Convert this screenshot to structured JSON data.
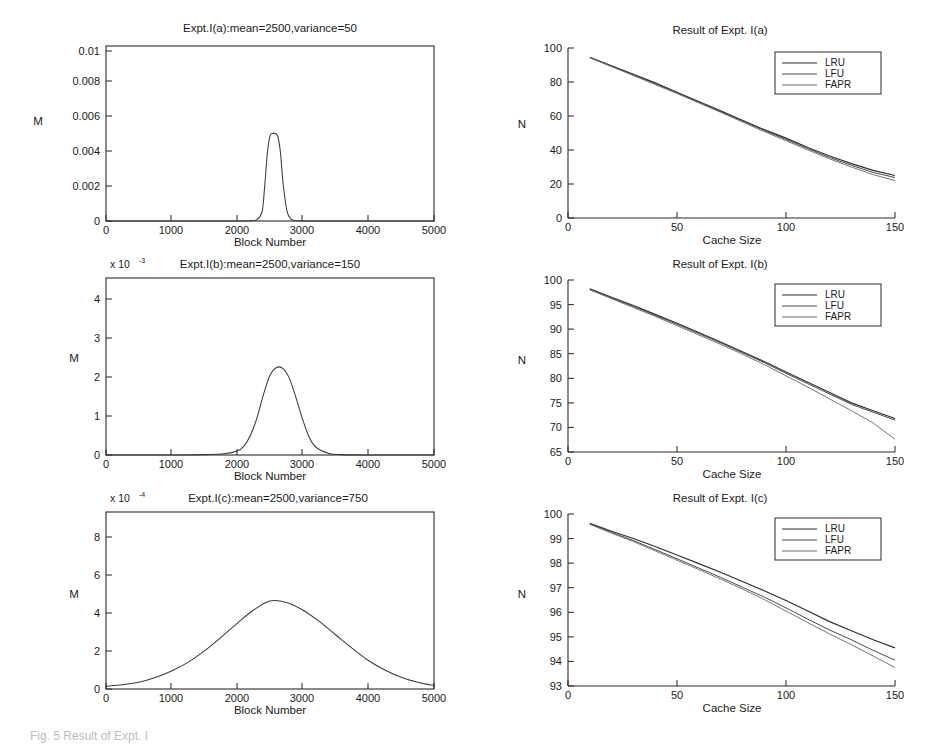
{
  "figure": {
    "caption": "Fig. 5 Result of Expt. I",
    "axis_labels": {
      "block_number": "Block Number",
      "cache_size": "Cache Size",
      "m": "M",
      "n": "N"
    },
    "legend_entries": [
      "LRU",
      "LFU",
      "FAPR"
    ],
    "exponent_prefix": "x 10"
  },
  "chart_data": [
    {
      "id": "expt-1a-distribution",
      "type": "line",
      "title": "Expt.I(a):mean=2500,variance=50",
      "xlabel": "Block Number",
      "ylabel": "M",
      "xlim": [
        0,
        5000
      ],
      "ylim": [
        0,
        0.0108
      ],
      "xticks": [
        0,
        1000,
        2000,
        3000,
        4000,
        5000
      ],
      "xtick_labels": [
        "0",
        "1000",
        "2000",
        "3000",
        "4000",
        "5000"
      ],
      "yticks": [
        0,
        0.002,
        0.004,
        0.006,
        0.008,
        0.01
      ],
      "ytick_labels": [
        "0",
        "0.002",
        "0.004",
        "0.006",
        "0.008",
        "0.01"
      ],
      "exponent": "",
      "grid": false,
      "distribution": {
        "mean": 2500,
        "variance": 50,
        "std_dev": 75,
        "peak_value": 0.0054
      },
      "x": [
        0,
        500,
        1000,
        1500,
        2000,
        2200,
        2300,
        2380,
        2420,
        2460,
        2500,
        2540,
        2580,
        2620,
        2660,
        2700,
        2760,
        2820,
        2900,
        3000,
        3500,
        4000,
        4500,
        5000
      ],
      "values": [
        0,
        0,
        0,
        0,
        0,
        2e-05,
        8e-05,
        0.0006,
        0.0022,
        0.0042,
        0.00525,
        0.0054,
        0.0054,
        0.0052,
        0.0042,
        0.0023,
        0.0006,
        0.00012,
        2e-05,
        0,
        0,
        0,
        0,
        0
      ]
    },
    {
      "id": "expt-1a-result",
      "type": "line",
      "title": "Result of Expt. I(a)",
      "xlabel": "Cache Size",
      "ylabel": "N",
      "xlim": [
        0,
        150
      ],
      "ylim": [
        0,
        100
      ],
      "xticks": [
        0,
        50,
        100,
        150
      ],
      "xtick_labels": [
        "0",
        "50",
        "100",
        "150"
      ],
      "yticks": [
        0,
        20,
        40,
        60,
        80,
        100
      ],
      "ytick_labels": [
        "0",
        "20",
        "40",
        "60",
        "80",
        "100"
      ],
      "grid": false,
      "legend_position": "top-right",
      "x": [
        10,
        20,
        30,
        40,
        50,
        60,
        70,
        80,
        90,
        100,
        110,
        120,
        130,
        140,
        150
      ],
      "series": [
        {
          "name": "LRU",
          "values": [
            94.5,
            89.5,
            84.5,
            79.5,
            74.0,
            68.5,
            63.0,
            57.5,
            52.0,
            47.0,
            41.5,
            36.5,
            32.0,
            28.0,
            25.0
          ]
        },
        {
          "name": "LFU",
          "values": [
            94.5,
            89.3,
            84.2,
            79.0,
            73.6,
            68.1,
            62.6,
            57.0,
            51.5,
            46.2,
            40.8,
            35.6,
            31.0,
            26.8,
            23.8
          ]
        },
        {
          "name": "FAPR",
          "values": [
            94.3,
            89.0,
            83.8,
            78.5,
            73.2,
            67.7,
            62.2,
            56.5,
            50.8,
            45.5,
            40.0,
            34.8,
            30.0,
            25.5,
            22.0
          ]
        }
      ]
    },
    {
      "id": "expt-1b-distribution",
      "type": "line",
      "title": "Expt.I(b):mean=2500,variance=150",
      "xlabel": "Block Number",
      "ylabel": "M",
      "xlim": [
        0,
        5000
      ],
      "ylim": [
        0,
        4.55
      ],
      "xticks": [
        0,
        1000,
        2000,
        3000,
        4000,
        5000
      ],
      "xtick_labels": [
        "0",
        "1000",
        "2000",
        "3000",
        "4000",
        "5000"
      ],
      "yticks": [
        0,
        1,
        2,
        3,
        4
      ],
      "ytick_labels": [
        "0",
        "1",
        "2",
        "3",
        "4"
      ],
      "exponent": "x 10",
      "exponent_power": "-3",
      "grid": false,
      "distribution": {
        "mean": 2500,
        "variance": 150,
        "std_dev": 180,
        "peak_value": 2.25
      },
      "x": [
        0,
        500,
        1000,
        1500,
        1800,
        2000,
        2100,
        2200,
        2300,
        2400,
        2500,
        2600,
        2700,
        2800,
        2900,
        3000,
        3100,
        3200,
        3400,
        3600,
        4000,
        4500,
        5000
      ],
      "values": [
        0,
        0,
        0,
        0.01,
        0.03,
        0.1,
        0.22,
        0.5,
        0.95,
        1.55,
        2.05,
        2.25,
        2.22,
        1.95,
        1.45,
        0.9,
        0.45,
        0.2,
        0.04,
        0.01,
        0,
        0,
        0
      ]
    },
    {
      "id": "expt-1b-result",
      "type": "line",
      "title": "Result of Expt. I(b)",
      "xlabel": "Cache Size",
      "ylabel": "N",
      "xlim": [
        0,
        150
      ],
      "ylim": [
        65,
        100
      ],
      "xticks": [
        0,
        50,
        100,
        150
      ],
      "xtick_labels": [
        "0",
        "50",
        "100",
        "150"
      ],
      "yticks": [
        65,
        70,
        75,
        80,
        85,
        90,
        95,
        100
      ],
      "ytick_labels": [
        "65",
        "70",
        "75",
        "80",
        "85",
        "90",
        "95",
        "100"
      ],
      "grid": false,
      "legend_position": "top-right",
      "x": [
        10,
        20,
        30,
        40,
        50,
        60,
        70,
        80,
        90,
        100,
        110,
        120,
        130,
        140,
        150
      ],
      "series": [
        {
          "name": "LRU",
          "values": [
            98.2,
            96.5,
            94.8,
            93.0,
            91.2,
            89.3,
            87.4,
            85.4,
            83.4,
            81.3,
            79.2,
            77.1,
            75.0,
            73.4,
            71.8
          ]
        },
        {
          "name": "LFU",
          "values": [
            98.1,
            96.3,
            94.6,
            92.8,
            91.0,
            89.1,
            87.2,
            85.2,
            83.2,
            81.0,
            78.9,
            76.8,
            74.7,
            73.1,
            71.5
          ]
        },
        {
          "name": "FAPR",
          "values": [
            98.0,
            96.2,
            94.4,
            92.6,
            90.7,
            88.8,
            86.9,
            84.9,
            82.8,
            80.5,
            78.2,
            75.8,
            73.4,
            70.9,
            67.6
          ]
        }
      ]
    },
    {
      "id": "expt-1c-distribution",
      "type": "line",
      "title": "Expt.I(c):mean=2500,variance=750",
      "xlabel": "Block Number",
      "ylabel": "M",
      "xlim": [
        0,
        5000
      ],
      "ylim": [
        0,
        9.3
      ],
      "xticks": [
        0,
        1000,
        2000,
        3000,
        4000,
        5000
      ],
      "xtick_labels": [
        "0",
        "1000",
        "2000",
        "3000",
        "4000",
        "5000"
      ],
      "yticks": [
        0,
        2,
        4,
        6,
        8
      ],
      "ytick_labels": [
        "0",
        "2",
        "4",
        "6",
        "8"
      ],
      "exponent": "x 10",
      "exponent_power": "-4",
      "grid": false,
      "distribution": {
        "mean": 2500,
        "variance": 750,
        "std_dev": 870,
        "peak_value": 4.65
      },
      "x": [
        0,
        250,
        500,
        750,
        1000,
        1250,
        1500,
        1750,
        2000,
        2250,
        2500,
        2750,
        3000,
        3250,
        3500,
        3750,
        4000,
        4250,
        4500,
        4750,
        5000
      ],
      "values": [
        0.15,
        0.22,
        0.35,
        0.6,
        0.95,
        1.4,
        2.0,
        2.7,
        3.45,
        4.15,
        4.62,
        4.55,
        4.15,
        3.55,
        2.85,
        2.15,
        1.5,
        1.0,
        0.62,
        0.35,
        0.18
      ]
    },
    {
      "id": "expt-1c-result",
      "type": "line",
      "title": "Result of Expt. I(c)",
      "xlabel": "Cache Size",
      "ylabel": "N",
      "xlim": [
        0,
        150
      ],
      "ylim": [
        93,
        100
      ],
      "xticks": [
        0,
        50,
        100,
        150
      ],
      "xtick_labels": [
        "0",
        "50",
        "100",
        "150"
      ],
      "yticks": [
        93,
        94,
        95,
        96,
        97,
        98,
        99,
        100
      ],
      "ytick_labels": [
        "93",
        "94",
        "95",
        "96",
        "97",
        "98",
        "99",
        "100"
      ],
      "grid": false,
      "legend_position": "top-right",
      "x": [
        10,
        20,
        30,
        40,
        50,
        60,
        70,
        80,
        90,
        100,
        110,
        120,
        130,
        140,
        150
      ],
      "series": [
        {
          "name": "LRU",
          "values": [
            99.62,
            99.3,
            99.0,
            98.68,
            98.33,
            97.98,
            97.63,
            97.25,
            96.88,
            96.48,
            96.05,
            95.62,
            95.25,
            94.88,
            94.55
          ]
        },
        {
          "name": "LFU",
          "values": [
            99.6,
            99.25,
            98.92,
            98.55,
            98.18,
            97.8,
            97.42,
            97.02,
            96.62,
            96.18,
            95.72,
            95.28,
            94.88,
            94.45,
            94.05
          ]
        },
        {
          "name": "FAPR",
          "values": [
            99.58,
            99.22,
            98.88,
            98.5,
            98.12,
            97.74,
            97.35,
            96.95,
            96.52,
            96.05,
            95.58,
            95.12,
            94.68,
            94.22,
            93.75
          ]
        }
      ]
    }
  ]
}
